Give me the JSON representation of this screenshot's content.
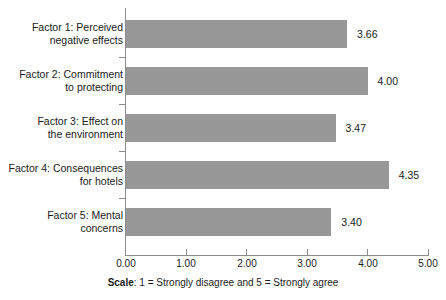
{
  "chart_data": {
    "type": "bar",
    "orientation": "horizontal",
    "title": "",
    "subtitle": "",
    "xlabel": "",
    "ylabel": "",
    "xlim": [
      0,
      5
    ],
    "xticks": [
      "0.00",
      "1.00",
      "2.00",
      "3.00",
      "4.00",
      "5.00"
    ],
    "grid": false,
    "legend": false,
    "bar_color": "#989898",
    "axis_color": "#8c8c8c",
    "categories": [
      "Factor 1: Perceived negative effects",
      "Factor 2: Commitment to protecting",
      "Factor 3: Effect on the environment",
      "Factor 4: Consequences for hotels",
      "Factor 5: Mental concerns"
    ],
    "category_lines": [
      [
        "Factor 1: Perceived",
        "negative effects"
      ],
      [
        "Factor 2: Commitment",
        "to protecting"
      ],
      [
        "Factor 3: Effect on",
        "the environment"
      ],
      [
        "Factor 4: Consequences",
        "for hotels"
      ],
      [
        "Factor 5: Mental",
        "concerns"
      ]
    ],
    "values": [
      3.66,
      4.0,
      3.47,
      4.35,
      3.4
    ],
    "value_labels": [
      "3.66",
      "4.00",
      "3.47",
      "4.35",
      "3.40"
    ]
  },
  "caption": {
    "bold_prefix": "Scale",
    "separator": ": ",
    "text": "1 = Strongly disagree and 5 = Strongly agree"
  }
}
